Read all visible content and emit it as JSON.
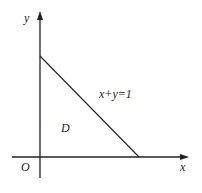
{
  "diagram": {
    "axes": {
      "x_label": "x",
      "y_label": "y",
      "origin_label": "O"
    },
    "line": {
      "equation": "x+y=1"
    },
    "region": {
      "label": "D"
    },
    "colors": {
      "stroke": "#222222",
      "background": "#ffffff"
    }
  }
}
